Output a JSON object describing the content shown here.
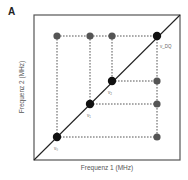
{
  "panel": {
    "label": "A"
  },
  "axes": {
    "xlabel": "Frequenz 1 (MHz)",
    "ylabel": "Frequenz 2 (MHz)"
  },
  "colors": {
    "frame": "#555555",
    "diagonal": "#222222",
    "diagonal_dot": "#111111",
    "offdiagonal_dot": "#555555",
    "dashed": "#444444"
  },
  "diagram": {
    "frame": {
      "x0": 34,
      "y0": 15,
      "x1": 180,
      "y1": 160
    },
    "diagonal_points": [
      {
        "x": 57,
        "y": 137,
        "label": "ν₀"
      },
      {
        "x": 90,
        "y": 104,
        "label": "ν₁"
      },
      {
        "x": 112,
        "y": 81,
        "label": "ν₂"
      },
      {
        "x": 157,
        "y": 36,
        "label": "ν_DQ"
      }
    ],
    "cross_peaks": [
      {
        "x": 57,
        "y": 36
      },
      {
        "x": 90,
        "y": 36
      },
      {
        "x": 112,
        "y": 36
      },
      {
        "x": 157,
        "y": 81
      },
      {
        "x": 157,
        "y": 104
      },
      {
        "x": 157,
        "y": 137
      }
    ]
  }
}
